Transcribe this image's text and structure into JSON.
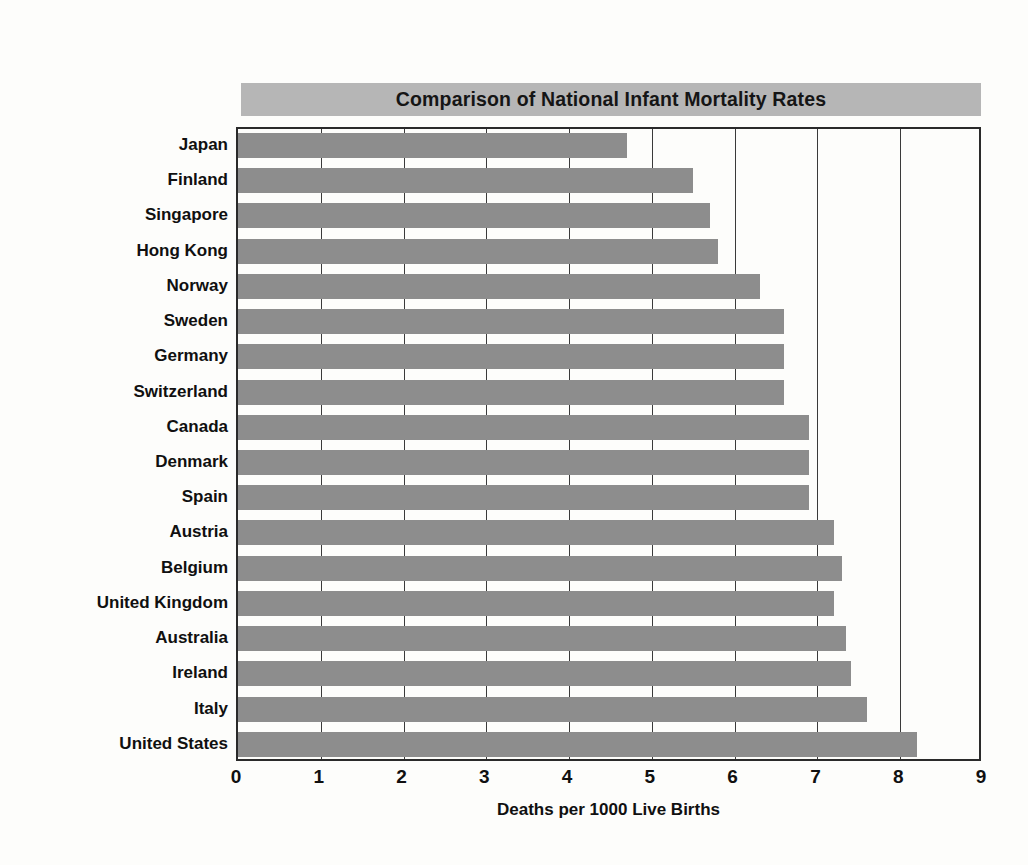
{
  "chart_data": {
    "type": "bar",
    "orientation": "horizontal",
    "title": "Comparison of National Infant Mortality Rates",
    "xlabel": "Deaths per 1000 Live Births",
    "ylabel": "",
    "xlim": [
      0,
      9
    ],
    "xticks": [
      "0",
      "1",
      "2",
      "3",
      "4",
      "5",
      "6",
      "7",
      "8",
      "9"
    ],
    "grid": "vertical",
    "legend": "none",
    "bar_color": "#8d8d8d",
    "title_banner_color": "#b6b6b6",
    "categories": [
      "Japan",
      "Finland",
      "Singapore",
      "Hong Kong",
      "Norway",
      "Sweden",
      "Germany",
      "Switzerland",
      "Canada",
      "Denmark",
      "Spain",
      "Austria",
      "Belgium",
      "United Kingdom",
      "Australia",
      "Ireland",
      "Italy",
      "United States"
    ],
    "values": [
      4.7,
      5.5,
      5.7,
      5.8,
      6.3,
      6.6,
      6.6,
      6.6,
      6.9,
      6.9,
      6.9,
      7.2,
      7.3,
      7.2,
      7.35,
      7.4,
      7.6,
      8.2
    ]
  }
}
